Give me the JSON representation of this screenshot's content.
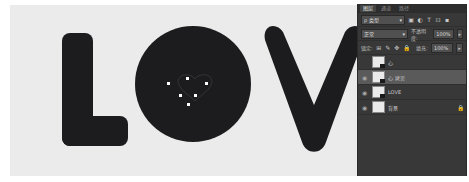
{
  "canvas": {
    "text": "LOV",
    "background_color": "#ebebeb",
    "glyph_color": "#1c1c1e",
    "path_anchor_count": 6
  },
  "panel": {
    "tabs": [
      {
        "label": "图层",
        "active": true
      },
      {
        "label": "通道",
        "active": false
      },
      {
        "label": "路径",
        "active": false
      }
    ],
    "filter": {
      "label": "ρ 类型",
      "arrow": "▾"
    },
    "filter_icons": [
      "image-filter-icon",
      "adjustment-filter-icon",
      "type-filter-icon",
      "shape-filter-icon",
      "smart-object-filter-icon"
    ],
    "filter_icon_glyphs": [
      "▣",
      "◐",
      "T",
      "⊡",
      "▪"
    ],
    "blend_mode": {
      "value": "正常",
      "arrow": "▾"
    },
    "opacity": {
      "label": "不透明度:",
      "value": "100%",
      "arrow": "▸"
    },
    "lock": {
      "label": "锁定:",
      "icons": [
        "⊞",
        "✎",
        "✥",
        "🔒"
      ]
    },
    "fill": {
      "label": "填充:",
      "value": "100%",
      "arrow": "▸"
    },
    "layers": [
      {
        "name": "心",
        "visible": false,
        "selected": false,
        "locked": false
      },
      {
        "name": "心 拷贝",
        "visible": true,
        "selected": true,
        "locked": false
      },
      {
        "name": "LOVE",
        "visible": true,
        "selected": false,
        "locked": false
      },
      {
        "name": "背景",
        "visible": true,
        "selected": false,
        "locked": true
      }
    ],
    "eye_glyph": "◉",
    "lock_glyph": "🔒"
  }
}
